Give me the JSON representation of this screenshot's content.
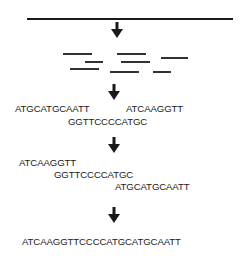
{
  "steps": {
    "genome": "long DNA molecule",
    "fragments": "random fragments",
    "reads": [
      "ATGCATGCAATT",
      "ATCAAGGTT",
      "GGTTCCCCATGC"
    ],
    "aligned": [
      "ATCAAGGTT",
      "GGTTCCCCATGC",
      "ATGCATGCAATT"
    ],
    "assembled": "ATCAAGGTTCCCCATGCATGCAATT"
  },
  "colors": {
    "ink": "#1a1a1a",
    "background": "#ffffff"
  }
}
